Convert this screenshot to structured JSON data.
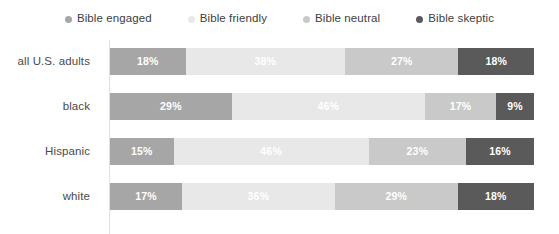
{
  "legend": {
    "position": "top-center",
    "items": [
      {
        "label": "Bible engaged",
        "color": "#a6a6a6",
        "marker": "dot-icon"
      },
      {
        "label": "Bible friendly",
        "color": "#e8e8e8",
        "marker": "dot-icon"
      },
      {
        "label": "Bible neutral",
        "color": "#c9c9c9",
        "marker": "dot-icon"
      },
      {
        "label": "Bible skeptic",
        "color": "#5a5a5a",
        "marker": "dot-icon"
      }
    ]
  },
  "rows": [
    {
      "label": "all U.S. adults",
      "cells": [
        {
          "value": 18,
          "text": "18%",
          "color": "#a6a6a6"
        },
        {
          "value": 38,
          "text": "38%",
          "color": "#e8e8e8"
        },
        {
          "value": 27,
          "text": "27%",
          "color": "#c9c9c9"
        },
        {
          "value": 18,
          "text": "18%",
          "color": "#5a5a5a"
        }
      ]
    },
    {
      "label": "black",
      "cells": [
        {
          "value": 29,
          "text": "29%",
          "color": "#a6a6a6"
        },
        {
          "value": 46,
          "text": "46%",
          "color": "#e8e8e8"
        },
        {
          "value": 17,
          "text": "17%",
          "color": "#c9c9c9"
        },
        {
          "value": 9,
          "text": "9%",
          "color": "#5a5a5a"
        }
      ]
    },
    {
      "label": "Hispanic",
      "cells": [
        {
          "value": 15,
          "text": "15%",
          "color": "#a6a6a6"
        },
        {
          "value": 46,
          "text": "46%",
          "color": "#e8e8e8"
        },
        {
          "value": 23,
          "text": "23%",
          "color": "#c9c9c9"
        },
        {
          "value": 16,
          "text": "16%",
          "color": "#5a5a5a"
        }
      ]
    },
    {
      "label": "white",
      "cells": [
        {
          "value": 17,
          "text": "17%",
          "color": "#a6a6a6"
        },
        {
          "value": 36,
          "text": "36%",
          "color": "#e8e8e8"
        },
        {
          "value": 29,
          "text": "29%",
          "color": "#c9c9c9"
        },
        {
          "value": 18,
          "text": "18%",
          "color": "#5a5a5a"
        }
      ]
    }
  ],
  "chart_data": {
    "type": "bar",
    "orientation": "horizontal",
    "stacked": true,
    "normalized": "100%",
    "title": "",
    "subtitle": "",
    "xlabel": "",
    "ylabel": "",
    "xlim": [
      0,
      100
    ],
    "grid": false,
    "legend_position": "top-center",
    "categories": [
      "all U.S. adults",
      "black",
      "Hispanic",
      "white"
    ],
    "series": [
      {
        "name": "Bible engaged",
        "color": "#a6a6a6",
        "values": [
          18,
          29,
          15,
          17
        ]
      },
      {
        "name": "Bible friendly",
        "color": "#e8e8e8",
        "values": [
          38,
          46,
          46,
          36
        ]
      },
      {
        "name": "Bible neutral",
        "color": "#c9c9c9",
        "values": [
          27,
          17,
          23,
          29
        ]
      },
      {
        "name": "Bible skeptic",
        "color": "#5a5a5a",
        "values": [
          18,
          9,
          16,
          18
        ]
      }
    ],
    "data_labels": [
      [
        "18%",
        "38%",
        "27%",
        "18%"
      ],
      [
        "29%",
        "46%",
        "17%",
        "9%"
      ],
      [
        "15%",
        "46%",
        "23%",
        "16%"
      ],
      [
        "17%",
        "36%",
        "29%",
        "18%"
      ]
    ],
    "annotations": []
  }
}
